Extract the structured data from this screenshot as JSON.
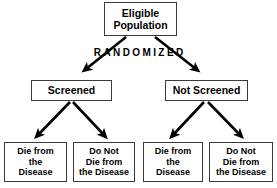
{
  "diagram": {
    "type": "flowchart",
    "title_text": "",
    "background_color": "#ffffff",
    "line_color": "#000000",
    "box_border_color": "#3a3a3a",
    "root": {
      "id": "eligible-population",
      "label": "Eligible\nPopulation"
    },
    "process_label": {
      "id": "randomized",
      "label": "RANDOMIZED"
    },
    "arms": [
      {
        "id": "screened",
        "label": "Screened"
      },
      {
        "id": "not-screened",
        "label": "Not Screened"
      }
    ],
    "outcomes": [
      {
        "id": "screened-die",
        "label": "Die from\nthe\nDisease",
        "parent": "screened"
      },
      {
        "id": "screened-not-die",
        "label": "Do Not\nDie from\nthe Disease",
        "parent": "screened"
      },
      {
        "id": "notscreened-die",
        "label": "Die from\nthe\nDisease",
        "parent": "not-screened"
      },
      {
        "id": "notscreened-not-die",
        "label": "Do Not\nDie from\nthe Disease",
        "parent": "not-screened"
      }
    ]
  }
}
